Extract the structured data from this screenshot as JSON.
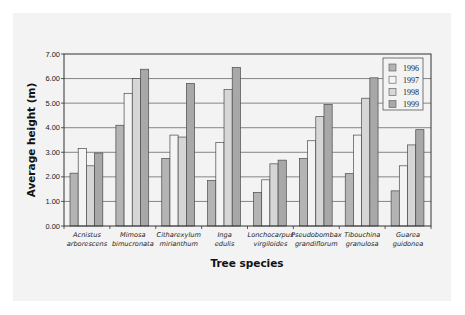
{
  "chart_data": {
    "type": "bar",
    "title": "",
    "xlabel": "Tree species",
    "ylabel": "Average height (m)",
    "ylim": [
      0,
      7
    ],
    "yticks": [
      "0.00",
      "1.00",
      "2.00",
      "3.00",
      "4.00",
      "5.00",
      "6.00",
      "7.00"
    ],
    "grid": true,
    "legend_position": "top-right inside",
    "categories": [
      [
        "Acnistus",
        "arborescens"
      ],
      [
        "Mimosa",
        "bimucronata"
      ],
      [
        "Citharexylum",
        "mirianthum"
      ],
      [
        "Inga",
        "edulis"
      ],
      [
        "Lonchocarpus",
        "virgiloides"
      ],
      [
        "Pseudobombax",
        "grandiflorum"
      ],
      [
        "Tibouchina",
        "granulosa"
      ],
      [
        "Guarea",
        "guidonea"
      ]
    ],
    "series": [
      {
        "name": "1996",
        "color": "#b4b4b4",
        "values": [
          2.15,
          4.1,
          2.75,
          1.85,
          1.37,
          2.75,
          2.13,
          1.43
        ]
      },
      {
        "name": "1997",
        "color": "#f4f4f4",
        "values": [
          3.16,
          5.4,
          3.7,
          3.4,
          1.88,
          3.47,
          3.7,
          2.45
        ]
      },
      {
        "name": "1998",
        "color": "#d6d6d6",
        "values": [
          2.45,
          6.0,
          3.62,
          5.55,
          2.53,
          4.45,
          5.2,
          3.3
        ]
      },
      {
        "name": "1999",
        "color": "#a8a8a8",
        "values": [
          2.97,
          6.38,
          5.8,
          6.45,
          2.68,
          4.95,
          6.03,
          3.92
        ]
      }
    ]
  },
  "labels": {
    "xlabel": "Tree species",
    "ylabel": "Average height (m)"
  }
}
